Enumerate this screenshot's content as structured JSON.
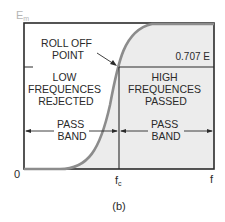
{
  "figure": {
    "caption": "(b)",
    "y_axis_label": "E",
    "y_axis_subscript": "m",
    "origin_label": "0",
    "x_axis_label": "f",
    "cutoff_label": "f",
    "cutoff_subscript": "c",
    "threshold_label": "0.707 E",
    "rolloff_label": [
      "ROLL OFF",
      "POINT"
    ],
    "low_region_label": [
      "LOW",
      "FREQUENCES",
      "REJECTED"
    ],
    "high_region_label": [
      "HIGH",
      "FREQUENCES",
      "PASSED"
    ],
    "left_band_label": [
      "PASS",
      "BAND"
    ],
    "right_band_label": [
      "PASS",
      "BAND"
    ]
  },
  "colors": {
    "frame": "#2b2b2b",
    "curve": "#8c8c8c",
    "shade": "#ececec",
    "text": "#2a2a2a",
    "axis_label_faint": "#b5b5b5"
  }
}
